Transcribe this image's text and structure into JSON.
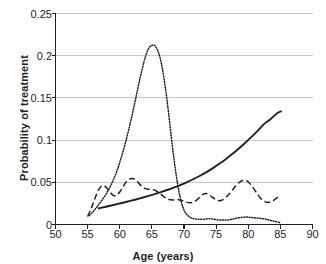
{
  "chart_data": {
    "type": "line",
    "title": "",
    "xlabel": "Age (years)",
    "ylabel": "Probability of treatment",
    "xlim": [
      50,
      90
    ],
    "ylim": [
      0,
      0.25
    ],
    "xticks": [
      50,
      55,
      60,
      65,
      70,
      75,
      80,
      85,
      90
    ],
    "xticklabels": [
      "50",
      "55",
      "60",
      "65",
      "70",
      "75",
      "80",
      "85",
      "90"
    ],
    "yticks": [
      0,
      0.05,
      0.1,
      0.15,
      0.2,
      0.25
    ],
    "yticklabels": [
      "0",
      "0.05",
      "0.1",
      "0.15",
      "0.2",
      "0.25"
    ],
    "grid": "horizontal",
    "legend": "none",
    "colors": {
      "axis": "#231f20",
      "grid": "#c8c8c8",
      "series": "#231f20",
      "background": "#ffffff"
    },
    "series": [
      {
        "name": "solid-curve",
        "style": "solid",
        "x": [
          56.6,
          57.5,
          58.5,
          59.5,
          60.5,
          61.5,
          62.5,
          63.5,
          64.5,
          65.5,
          66.5,
          67.5,
          68.5,
          69.5,
          70.5,
          71.5,
          72.5,
          73.5,
          74.5,
          75.5,
          76.5,
          77.5,
          78.5,
          79.5,
          80.5,
          81.5,
          82.5,
          83.5,
          84.5,
          85.2
        ],
        "y": [
          0.019,
          0.0205,
          0.0222,
          0.024,
          0.0258,
          0.0277,
          0.0296,
          0.0317,
          0.0339,
          0.0362,
          0.0386,
          0.0412,
          0.044,
          0.047,
          0.0503,
          0.0539,
          0.0578,
          0.0621,
          0.0668,
          0.0719,
          0.0774,
          0.0834,
          0.0898,
          0.0966,
          0.1038,
          0.1113,
          0.1192,
          0.1251,
          0.1318,
          0.1343
        ]
      },
      {
        "name": "dashed-curve",
        "style": "dashed",
        "x": [
          55.0,
          55.5,
          56.0,
          56.5,
          57.0,
          57.5,
          58.0,
          58.5,
          59.0,
          59.5,
          60.0,
          60.5,
          61.0,
          61.5,
          62.0,
          62.5,
          63.0,
          63.5,
          64.0,
          64.5,
          65.0,
          65.5,
          66.0,
          66.5,
          67.0,
          67.5,
          68.0,
          68.5,
          69.0,
          69.5,
          70.0,
          70.5,
          71.0,
          71.5,
          72.0,
          72.5,
          73.0,
          73.5,
          74.0,
          74.5,
          75.0,
          75.5,
          76.0,
          76.5,
          77.0,
          77.5,
          78.0,
          78.5,
          79.0,
          79.5,
          80.0,
          80.5,
          81.0,
          81.5,
          82.0,
          82.5,
          83.0,
          83.5,
          84.0,
          84.5,
          85.0
        ],
        "y": [
          0.0095,
          0.018,
          0.028,
          0.038,
          0.0445,
          0.046,
          0.0432,
          0.0385,
          0.0345,
          0.0345,
          0.0385,
          0.0445,
          0.0505,
          0.0538,
          0.0545,
          0.0528,
          0.0485,
          0.0448,
          0.0425,
          0.0418,
          0.0415,
          0.0405,
          0.0382,
          0.0352,
          0.0322,
          0.0302,
          0.0292,
          0.0292,
          0.0295,
          0.0288,
          0.0275,
          0.0262,
          0.0258,
          0.0265,
          0.0292,
          0.033,
          0.036,
          0.0368,
          0.0348,
          0.0318,
          0.0292,
          0.0282,
          0.0292,
          0.0318,
          0.0358,
          0.0405,
          0.0452,
          0.0492,
          0.0518,
          0.0525,
          0.0505,
          0.0462,
          0.0408,
          0.0352,
          0.0305,
          0.0275,
          0.0262,
          0.0268,
          0.029,
          0.0318,
          0.0345
        ]
      },
      {
        "name": "dotted-curve",
        "style": "dotted",
        "x": [
          55.3,
          56.0,
          56.6,
          57.2,
          57.8,
          58.4,
          59.0,
          59.6,
          60.2,
          60.8,
          61.4,
          62.0,
          62.6,
          63.2,
          63.8,
          64.2,
          64.6,
          65.0,
          65.3,
          65.6,
          66.0,
          66.3,
          66.6,
          67.0,
          67.3,
          67.6,
          68.0,
          68.4,
          68.8,
          69.2,
          69.6,
          70.0,
          70.4,
          71.0,
          71.6,
          72.2,
          73.0,
          74.0,
          75.0,
          76.0,
          77.0,
          78.0,
          79.0,
          79.8,
          80.5,
          81.2,
          82.0,
          83.0,
          84.0,
          85.0
        ],
        "y": [
          0.0108,
          0.0165,
          0.0225,
          0.0285,
          0.0352,
          0.0432,
          0.0528,
          0.0645,
          0.0785,
          0.0945,
          0.1125,
          0.1322,
          0.1535,
          0.1748,
          0.1935,
          0.2035,
          0.2098,
          0.2122,
          0.2125,
          0.2108,
          0.2045,
          0.1968,
          0.1862,
          0.1672,
          0.1508,
          0.1322,
          0.1055,
          0.0802,
          0.0578,
          0.0395,
          0.0262,
          0.0172,
          0.0122,
          0.0082,
          0.0068,
          0.0062,
          0.0062,
          0.0068,
          0.0058,
          0.0052,
          0.0055,
          0.0072,
          0.0085,
          0.0088,
          0.0082,
          0.0078,
          0.0072,
          0.0058,
          0.0038,
          0.0022
        ]
      }
    ]
  },
  "axes": {
    "x_title": "Age (years)",
    "y_title": "Probability of treatment"
  }
}
